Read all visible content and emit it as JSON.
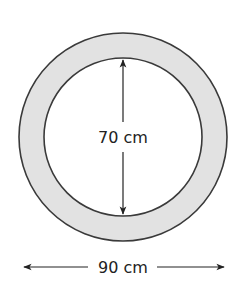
{
  "diagram": {
    "type": "annulus",
    "outer_diameter_label": "90 cm",
    "inner_diameter_label": "70 cm",
    "ring_fill": "#e2e2e2",
    "stroke_color": "#3a3a3a",
    "inner_fill": "#ffffff"
  }
}
